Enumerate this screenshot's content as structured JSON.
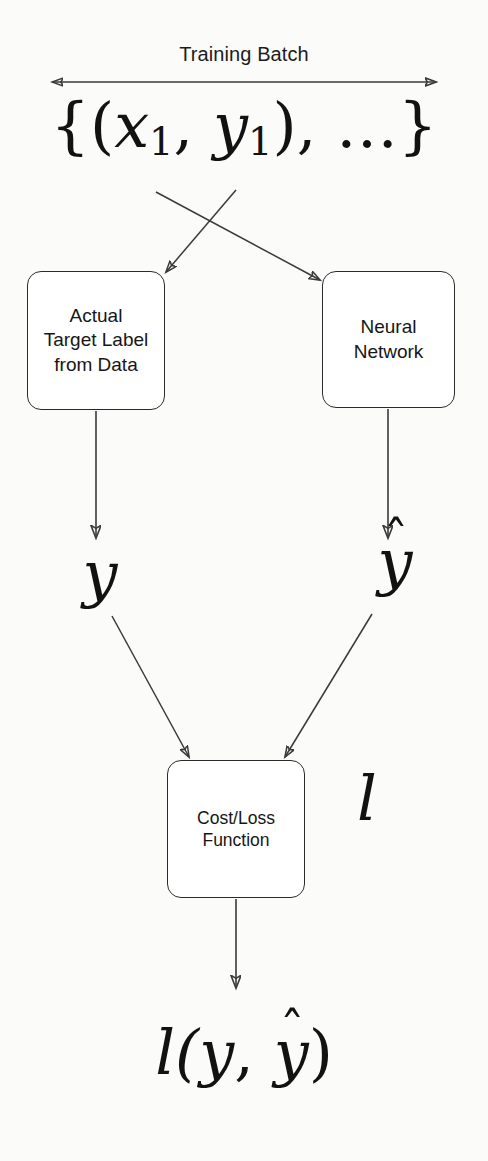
{
  "figure": {
    "background_color": "#fbfbfa",
    "stroke_color": "#3a3a3a",
    "text_color": "#1c1c1c"
  },
  "header": {
    "span_label": "Training Batch",
    "batch_set_notation": {
      "open_brace": "{(",
      "x_symbol": "x",
      "x_subscript": "1",
      "comma_1": ", ",
      "y_symbol": "y",
      "y_subscript": "1",
      "close_paren": "), ",
      "ellipsis": "…",
      "close_brace": "}",
      "plain": "{(x1, y1), …}"
    }
  },
  "nodes": [
    {
      "id": "target-label",
      "label": "Actual\nTarget Label\nfrom Data"
    },
    {
      "id": "neural-network",
      "label": "Neural\nNetwork"
    },
    {
      "id": "cost-loss",
      "label": "Cost/Loss\nFunction"
    }
  ],
  "symbols": {
    "y": "y",
    "y_hat_base": "y",
    "y_hat_mark": "ˆ",
    "loss_l": "l"
  },
  "output": {
    "expression_prefix": "l(",
    "expression_y": "y",
    "expression_comma": ", ",
    "expression_yhat_base": "y",
    "expression_yhat_mark": "ˆ",
    "expression_suffix": ")",
    "plain": "l(y, ŷ)"
  },
  "edges": [
    {
      "id": "span-arrow",
      "from": "left-extent",
      "to": "right-extent",
      "kind": "double-headed"
    },
    {
      "id": "x-to-neural-net",
      "from": "x1",
      "to": "neural-network",
      "kind": "single-arrow"
    },
    {
      "id": "y-to-target-label",
      "from": "y1",
      "to": "target-label",
      "kind": "single-arrow"
    },
    {
      "id": "target-to-y",
      "from": "target-label",
      "to": "y",
      "kind": "single-arrow"
    },
    {
      "id": "net-to-yhat",
      "from": "neural-network",
      "to": "y-hat",
      "kind": "single-arrow"
    },
    {
      "id": "y-to-cost",
      "from": "y",
      "to": "cost-loss",
      "kind": "single-arrow"
    },
    {
      "id": "yhat-to-cost",
      "from": "y-hat",
      "to": "cost-loss",
      "kind": "single-arrow"
    },
    {
      "id": "cost-to-output",
      "from": "cost-loss",
      "to": "loss-output",
      "kind": "single-arrow"
    }
  ]
}
